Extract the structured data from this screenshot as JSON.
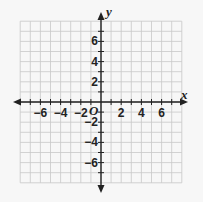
{
  "chart_data": {
    "type": "scatter",
    "title": "",
    "xlabel": "x",
    "ylabel": "y",
    "origin_label": "O",
    "xlim": [
      -8,
      8
    ],
    "ylim": [
      -8,
      8
    ],
    "grid": true,
    "x_ticks": [
      -6,
      -4,
      -2,
      2,
      4,
      6
    ],
    "y_ticks": [
      6,
      4,
      2,
      -2,
      -4,
      -6
    ],
    "x_tick_labels": [
      "−6",
      "−4",
      "−2",
      "2",
      "4",
      "6"
    ],
    "y_tick_labels": [
      "6",
      "4",
      "2",
      "−2",
      "−4",
      "−6"
    ],
    "points": [],
    "colors": {
      "background": "#f7f7f7",
      "grid": "#c8c8c8",
      "axis": "#222222"
    }
  }
}
